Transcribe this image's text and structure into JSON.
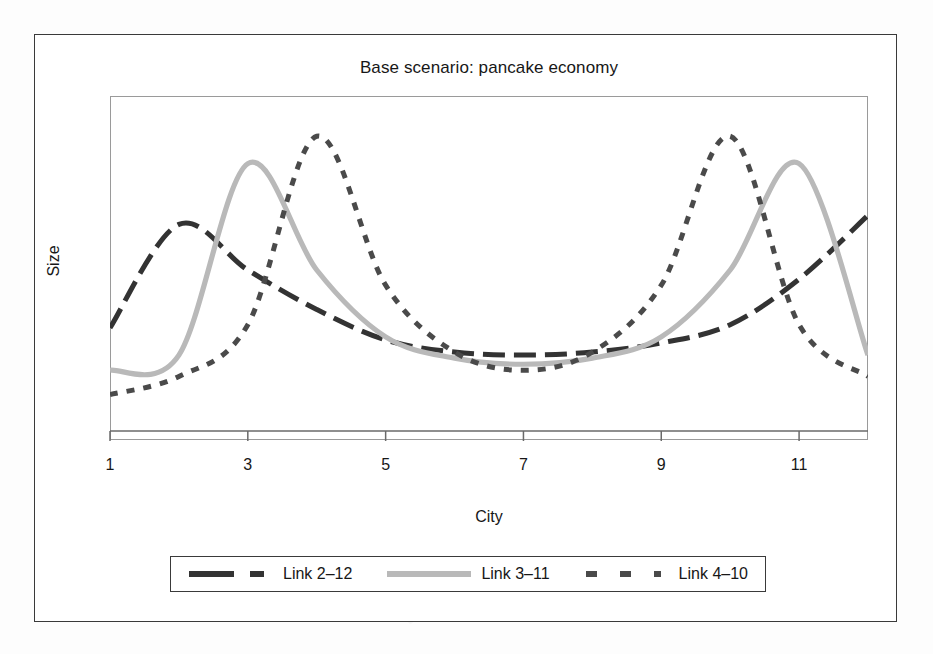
{
  "chart_data": {
    "type": "line",
    "title": "Base scenario: pancake economy",
    "xlabel": "City",
    "ylabel": "Size",
    "xlim": [
      1,
      12
    ],
    "ylim": [
      0,
      1
    ],
    "grid": false,
    "xticks": [
      1,
      3,
      5,
      7,
      9,
      11
    ],
    "xtick_labels": [
      "1",
      "3",
      "5",
      "7",
      "9",
      "11"
    ],
    "ytick_labels": [],
    "legend_position": "bottom-outside",
    "x": [
      1,
      2,
      3,
      4,
      5,
      6,
      7,
      8,
      9,
      10,
      11,
      12
    ],
    "series": [
      {
        "name": "Link 2–12",
        "color": "#333333",
        "style": "long-dash",
        "values": [
          0.31,
          0.65,
          0.5,
          0.37,
          0.27,
          0.23,
          0.22,
          0.23,
          0.26,
          0.32,
          0.47,
          0.68
        ]
      },
      {
        "name": "Link 3–11",
        "color": "#b9b9b9",
        "style": "solid",
        "values": [
          0.17,
          0.22,
          0.85,
          0.5,
          0.28,
          0.21,
          0.19,
          0.21,
          0.28,
          0.5,
          0.85,
          0.22
        ]
      },
      {
        "name": "Link 4–10",
        "color": "#4a4a4a",
        "style": "fine-dot",
        "values": [
          0.09,
          0.15,
          0.32,
          0.94,
          0.45,
          0.23,
          0.17,
          0.23,
          0.45,
          0.94,
          0.32,
          0.15
        ]
      }
    ]
  },
  "figure": {
    "title": "Base scenario: pancake economy",
    "x_axis_label": "City",
    "y_axis_label": "Size",
    "x_tick_labels": [
      "1",
      "3",
      "5",
      "7",
      "9",
      "11"
    ],
    "legend": {
      "items": [
        {
          "label": "Link 2–12",
          "sample": "long-dash-sample",
          "color": "#333333"
        },
        {
          "label": "Link 3–11",
          "sample": "solid-gray-sample",
          "color": "#b9b9b9"
        },
        {
          "label": "Link 4–10",
          "sample": "fine-dot-sample",
          "color": "#4a4a4a"
        }
      ]
    }
  }
}
